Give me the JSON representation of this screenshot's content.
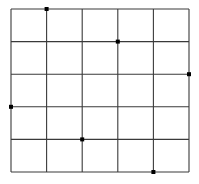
{
  "diagram": {
    "type": "grid-with-points",
    "columns": 5,
    "rows": 5,
    "line_color": "#3a3a3a",
    "point_color": "#000000",
    "background": "#ffffff",
    "x_lines": [
      11,
      46.6,
      82.2,
      117.8,
      153.4,
      189
    ],
    "y_lines": [
      9,
      41.6,
      74.2,
      106.8,
      139.4,
      172
    ],
    "points": [
      {
        "col": 1,
        "row": 0
      },
      {
        "col": 3,
        "row": 1
      },
      {
        "col": 5,
        "row": 2
      },
      {
        "col": 0,
        "row": 3
      },
      {
        "col": 2,
        "row": 4
      },
      {
        "col": 4,
        "row": 5
      }
    ]
  }
}
